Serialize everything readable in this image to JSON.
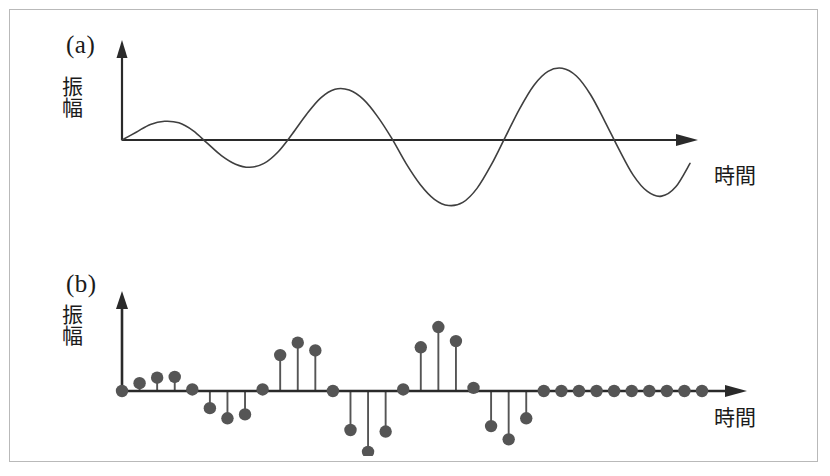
{
  "figure": {
    "background_color": "#ffffff",
    "frame_color": "#b9b9b9",
    "ink_color": "#3f3f3f",
    "axis_color": "#2a2a2a",
    "marker_color": "#555555",
    "label_color": "#1b1b1b"
  },
  "panels": [
    {
      "id": "a",
      "label": "(a)",
      "ylabel": "振幅",
      "xlabel": "時間"
    },
    {
      "id": "b",
      "label": "(b)",
      "ylabel": "振幅",
      "xlabel": "時間"
    }
  ],
  "chart_data": [
    {
      "type": "line",
      "id": "panel-a-continuous-waveform",
      "title": "(a)",
      "xlabel": "時間",
      "ylabel": "振幅",
      "grid": false,
      "legend": null,
      "axis_arrows": {
        "x": true,
        "y": true
      },
      "xlim": [
        0,
        40
      ],
      "ylim": [
        -1.05,
        1.05
      ],
      "description": "Continuous sinusoid of growing then saturating amplitude, drawn as a smooth curve; amplitude envelope ramps up over the first cycles.",
      "x": [
        0,
        1,
        2,
        3,
        4,
        5,
        6,
        7,
        8,
        9,
        10,
        11,
        12,
        13,
        14,
        15,
        16,
        17,
        18,
        19,
        20,
        21,
        22,
        23,
        24,
        25,
        26,
        27,
        28,
        29,
        30,
        31,
        32,
        33,
        34,
        35,
        36,
        37,
        38,
        39,
        40
      ],
      "values": [
        0.0,
        0.1,
        0.2,
        0.24,
        0.22,
        0.12,
        -0.04,
        -0.2,
        -0.31,
        -0.35,
        -0.3,
        -0.15,
        0.08,
        0.33,
        0.54,
        0.65,
        0.64,
        0.52,
        0.3,
        0.02,
        -0.3,
        -0.57,
        -0.76,
        -0.84,
        -0.8,
        -0.62,
        -0.32,
        0.04,
        0.4,
        0.7,
        0.88,
        0.92,
        0.82,
        0.58,
        0.24,
        -0.12,
        -0.45,
        -0.66,
        -0.72,
        -0.6,
        -0.3
      ]
    },
    {
      "type": "stem",
      "id": "panel-b-sampled-waveform",
      "title": "(b)",
      "xlabel": "時間",
      "ylabel": "振幅",
      "grid": false,
      "legend": null,
      "axis_arrows": {
        "x": true,
        "y": true
      },
      "xlim": [
        0,
        33
      ],
      "ylim": [
        -1.05,
        1.05
      ],
      "description": "Discrete sampled version of the (a) waveform, drawn as stems with round markers at each sample instant.",
      "sample_count": 34,
      "x": [
        0,
        1,
        2,
        3,
        4,
        5,
        6,
        7,
        8,
        9,
        10,
        11,
        12,
        13,
        14,
        15,
        16,
        17,
        18,
        19,
        20,
        21,
        22,
        23,
        24,
        25,
        26,
        27,
        28,
        29,
        30,
        31,
        32,
        33
      ],
      "values": [
        0.0,
        0.1,
        0.17,
        0.18,
        0.02,
        -0.22,
        -0.35,
        -0.3,
        0.02,
        0.46,
        0.62,
        0.52,
        0.0,
        -0.5,
        -0.78,
        -0.52,
        0.02,
        0.56,
        0.82,
        0.64,
        0.04,
        -0.45,
        -0.62,
        -0.35,
        0.0,
        0.0,
        0.0,
        0.0,
        0.0,
        0.0,
        0.0,
        0.0,
        0.0,
        0.0
      ]
    }
  ]
}
